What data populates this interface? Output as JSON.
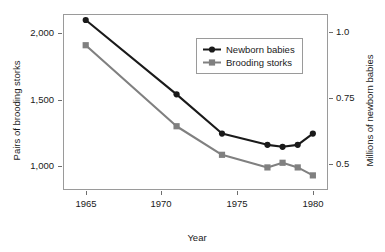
{
  "chart_data": {
    "type": "line",
    "title": "",
    "subtitle": "",
    "xlabel": "Year",
    "ylabel": "Pairs of brooding storks",
    "y2label": "Millions of newborn babies",
    "x": [
      1965,
      1971,
      1974,
      1977,
      1978,
      1979,
      1980
    ],
    "xlim": [
      1963.5,
      1981.0
    ],
    "xticks": [
      1965,
      1970,
      1975,
      1980
    ],
    "xtick_labels": [
      "1965",
      "1970",
      "1975",
      "1980"
    ],
    "ylim": [
      820,
      2145
    ],
    "yticks": [
      1000,
      1500,
      2000
    ],
    "ytick_labels": [
      "1,000",
      "1,500",
      "2,000"
    ],
    "y2lim": [
      0.4,
      1.07
    ],
    "y2ticks": [
      0.5,
      0.75,
      1.0
    ],
    "y2tick_labels": [
      "0.5",
      "0.75",
      "1.0"
    ],
    "grid": false,
    "legend_position": "top-right-inside",
    "series": [
      {
        "name": "Newborn babies",
        "axis": "right",
        "color": "#1a1a1a",
        "marker": "circle",
        "values_millions": [
          1.055,
          0.775,
          0.625,
          0.578,
          0.572,
          0.578,
          0.625
        ],
        "values_left_scale": [
          2100,
          1540,
          1245,
          1160,
          1145,
          1160,
          1245
        ]
      },
      {
        "name": "Brooding storks",
        "axis": "left",
        "color": "#808080",
        "marker": "square",
        "values": [
          1910,
          1300,
          1085,
          990,
          1025,
          990,
          930
        ]
      }
    ]
  },
  "legend": {
    "items": [
      {
        "label": "Newborn babies"
      },
      {
        "label": "Brooding storks"
      }
    ]
  },
  "colors": {
    "series_newborn": "#1a1a1a",
    "series_storks": "#808080",
    "frame": "#9a9a9a",
    "background": "#ffffff"
  }
}
